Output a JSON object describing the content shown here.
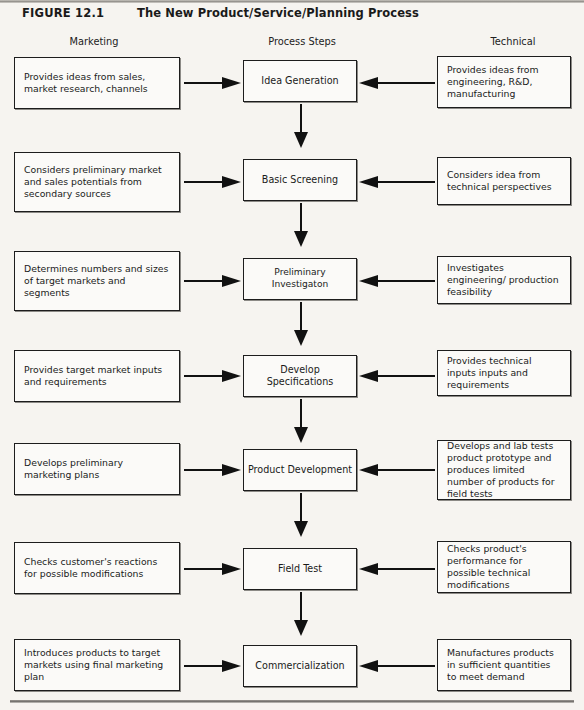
{
  "figure": {
    "number": "FIGURE 12.1",
    "title": "The New Product/Service/Planning Process"
  },
  "columns": {
    "left": "Marketing",
    "center": "Process Steps",
    "right": "Technical"
  },
  "colors": {
    "page_background": "#f6f4f0",
    "box_fill": "#fbfaf8",
    "ink": "#1d1d1d",
    "rule": "#8d8a85"
  },
  "rows": [
    {
      "left": "Provides ideas from sales, market research, channels",
      "center": "Idea Generation",
      "right": "Provides ideas from engineering, R&D, manufacturing"
    },
    {
      "left": "Considers preliminary market and sales potentials from secondary sources",
      "center": "Basic Screening",
      "right": "Considers idea from technical perspectives"
    },
    {
      "left": "Determines numbers and sizes of target markets and segments",
      "center": "Preliminary Investigaton",
      "right": "Investigates engineering/ production feasibility"
    },
    {
      "left": "Provides target market inputs and requirements",
      "center": "Develop Specifications",
      "right": "Provides technical inputs inputs and requirements"
    },
    {
      "left": "Develops preliminary marketing plans",
      "center": "Product Development",
      "right": "Develops and lab tests product prototype and produces limited number of products for field tests"
    },
    {
      "left": "Checks customer's reactions for possible modifications",
      "center": "Field Test",
      "right": "Checks product's performance for possible technical modifications"
    },
    {
      "left": "Introduces products to target markets using final marketing plan",
      "center": "Commercialization",
      "right": "Manufactures products in sufficient quantities to meet demand"
    }
  ]
}
